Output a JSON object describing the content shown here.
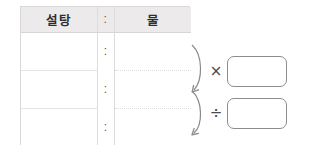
{
  "table": {
    "headers": {
      "left": "설탕",
      "separator": ":",
      "right": "물"
    },
    "rows": [
      {
        "left": "",
        "separator": ":",
        "right": ""
      },
      {
        "left": "",
        "separator": ":",
        "right": ""
      },
      {
        "left": "",
        "separator": ":",
        "right": ""
      }
    ]
  },
  "operations": [
    {
      "symbol": "×",
      "icon": "multiply-icon",
      "arrow": "curved-down-arrow",
      "answer_value": ""
    },
    {
      "symbol": "÷",
      "icon": "divide-icon",
      "arrow": "curved-down-arrow",
      "answer_value": ""
    }
  ],
  "colors": {
    "header_background": "#eceaea",
    "table_border": "#d8d8d8",
    "row_divider": "#e4e4e4",
    "arrow_stroke": "#8a8a8a",
    "box_border": "#8c8c8c",
    "text": "#2e2e2e",
    "page_background": "#ffffff"
  }
}
